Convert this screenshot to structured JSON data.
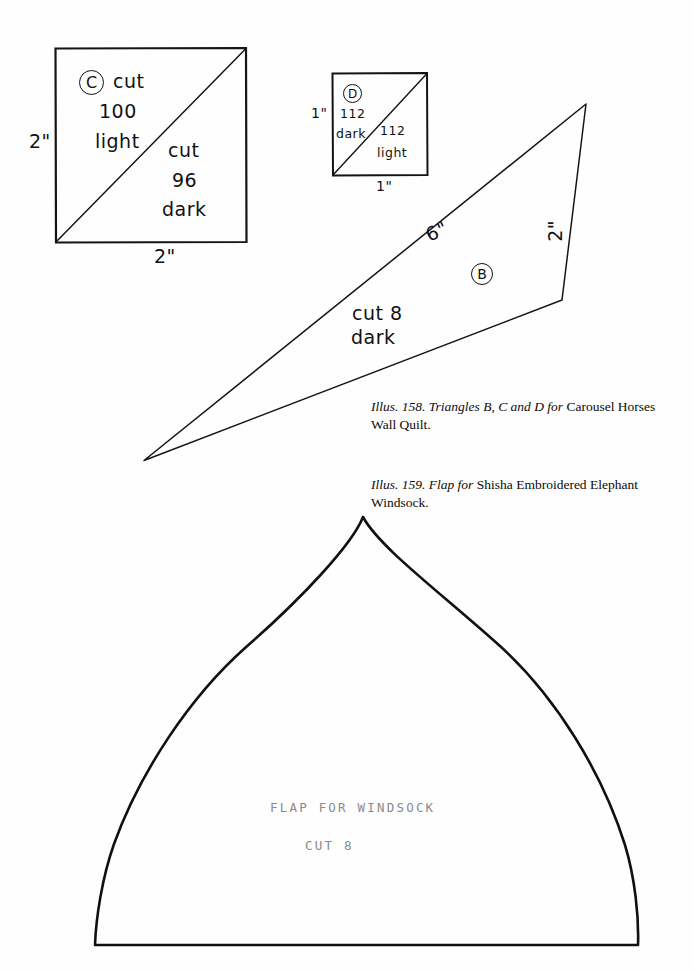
{
  "page": {
    "background": "#fefefe",
    "ink": "#111111",
    "typed_ink": "#8a8a8a"
  },
  "figure_158": {
    "caption_italic": "Illus. 158. Triangles B, C and D for",
    "caption_roman": " Carousel Horses Wall Quilt.",
    "square_c": {
      "badge": "C",
      "upper_label_line1": "cut",
      "upper_label_line2": "100",
      "upper_label_line3": "light",
      "lower_label_line1": "cut",
      "lower_label_line2": "96",
      "lower_label_line3": "dark",
      "dim_left": "2\"",
      "dim_bottom": "2\""
    },
    "square_d": {
      "badge": "D",
      "upper_label_line1": "112",
      "upper_label_line2": "dark",
      "lower_label_line1": "112",
      "lower_label_line2": "light",
      "dim_left": "1\"",
      "dim_bottom": "1\""
    },
    "triangle_b": {
      "badge": "B",
      "label_line1": "cut 8",
      "label_line2": "dark",
      "dim_hypotenuse": "6\"",
      "dim_right": "2\""
    }
  },
  "figure_159": {
    "caption_italic": "Illus. 159. Flap for",
    "caption_roman": " Shisha Embroidered Elephant Windsock.",
    "flap": {
      "typed_line1": "FLAP FOR WINDSOCK",
      "typed_line2": "CUT 8"
    }
  }
}
